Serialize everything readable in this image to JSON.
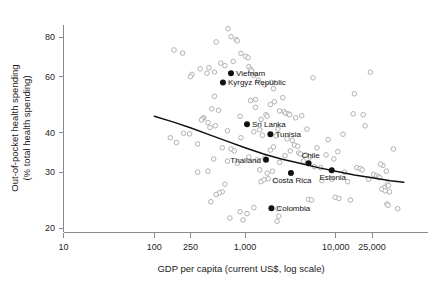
{
  "chart_data": {
    "type": "scatter",
    "title": "",
    "xlabel": "GDP per capita (current US$, log scale)",
    "ylabel": "Out-of-pocket health spending\n(% total health spending)",
    "ylabel_line1": "Out-of-pocket health spending",
    "ylabel_line2": "(% total health spending)",
    "x_scale": "log",
    "y_scale": "log",
    "xlim": [
      10,
      60000
    ],
    "ylim": [
      19,
      88
    ],
    "grid": false,
    "legend": false,
    "xticks": [
      10,
      100,
      250,
      1000,
      10000,
      25000
    ],
    "xtick_labels": [
      "10",
      "100",
      "250",
      "1,000",
      "10,000",
      "25,000"
    ],
    "yticks": [
      20,
      30,
      40,
      60,
      80
    ],
    "ytick_labels": [
      "20",
      "30",
      "40",
      "60",
      "80"
    ],
    "series": [
      {
        "name": "countries-unlabeled",
        "marker": "open-circle",
        "color": "#a9a9a9",
        "points": [
          [
            650,
            85
          ],
          [
            700,
            80.2
          ],
          [
            800,
            78.5
          ],
          [
            820,
            77.8
          ],
          [
            480,
            77.2
          ],
          [
            165,
            72.8
          ],
          [
            205,
            71.2
          ],
          [
            900,
            71.0
          ],
          [
            1020,
            69.5
          ],
          [
            1080,
            68.8
          ],
          [
            740,
            67.0
          ],
          [
            540,
            66.2
          ],
          [
            600,
            65.0
          ],
          [
            1100,
            64.5
          ],
          [
            400,
            64.0
          ],
          [
            320,
            63.5
          ],
          [
            1150,
            63.2
          ],
          [
            1180,
            62.5
          ],
          [
            24000,
            62.0
          ],
          [
            460,
            62.0
          ],
          [
            380,
            61.5
          ],
          [
            260,
            61.0
          ],
          [
            1250,
            60.5
          ],
          [
            5600,
            59.5
          ],
          [
            250,
            60.0
          ],
          [
            1400,
            58.5
          ],
          [
            1950,
            57.5
          ],
          [
            1650,
            56.5
          ],
          [
            2050,
            55.0
          ],
          [
            16000,
            53.0
          ],
          [
            460,
            52.0
          ],
          [
            2600,
            51.5
          ],
          [
            2100,
            50.0
          ],
          [
            1900,
            49.0
          ],
          [
            1300,
            48.0
          ],
          [
            430,
            47.5
          ],
          [
            510,
            47.0
          ],
          [
            2400,
            46.8
          ],
          [
            2700,
            46.5
          ],
          [
            2800,
            46.0
          ],
          [
            3000,
            45.8
          ],
          [
            3100,
            45.5
          ],
          [
            1700,
            45.5
          ],
          [
            1750,
            45.0
          ],
          [
            880,
            45.0
          ],
          [
            350,
            44.5
          ],
          [
            340,
            44.2
          ],
          [
            330,
            43.8
          ],
          [
            4200,
            45.2
          ],
          [
            20000,
            45.5
          ],
          [
            390,
            43.0
          ],
          [
            3600,
            44.5
          ],
          [
            1500,
            44.0
          ],
          [
            470,
            42.0
          ],
          [
            410,
            41.5
          ],
          [
            21000,
            42.0
          ],
          [
            2300,
            41.0
          ],
          [
            1450,
            40.8
          ],
          [
            1250,
            40.2
          ],
          [
            4800,
            41.0
          ],
          [
            640,
            40.5
          ],
          [
            210,
            39.8
          ],
          [
            245,
            39.6
          ],
          [
            1550,
            39.2
          ],
          [
            2200,
            39.0
          ],
          [
            900,
            38.5
          ],
          [
            2900,
            38.2
          ],
          [
            3300,
            37.8
          ],
          [
            8200,
            38.0
          ],
          [
            150,
            38.5
          ],
          [
            175,
            37.2
          ],
          [
            300,
            36.8
          ],
          [
            3500,
            36.5
          ],
          [
            3800,
            36.2
          ],
          [
            2050,
            36.0
          ],
          [
            43000,
            35.5
          ],
          [
            10500,
            34.8
          ],
          [
            700,
            35.5
          ],
          [
            760,
            35.0
          ],
          [
            560,
            35.8
          ],
          [
            1900,
            35.2
          ],
          [
            3150,
            35.0
          ],
          [
            3900,
            34.5
          ],
          [
            4100,
            34.2
          ],
          [
            4600,
            34.0
          ],
          [
            2750,
            33.8
          ],
          [
            5200,
            33.5
          ],
          [
            1650,
            33.2
          ],
          [
            9500,
            33.0
          ],
          [
            1100,
            33.5
          ],
          [
            1350,
            32.8
          ],
          [
            4400,
            32.5
          ],
          [
            2400,
            32.2
          ],
          [
            640,
            32.5
          ],
          [
            33000,
            31.5
          ],
          [
            5800,
            31.2
          ],
          [
            17000,
            31.0
          ],
          [
            18500,
            30.8
          ],
          [
            19500,
            30.5
          ],
          [
            31000,
            31.8
          ],
          [
            36000,
            30.2
          ],
          [
            12500,
            30.0
          ],
          [
            2000,
            30.2
          ],
          [
            1750,
            29.8
          ],
          [
            26000,
            29.5
          ],
          [
            28000,
            29.2
          ],
          [
            29500,
            29.0
          ],
          [
            30500,
            28.8
          ],
          [
            9000,
            28.5
          ],
          [
            7000,
            28.2
          ],
          [
            1500,
            28.0
          ],
          [
            1620,
            28.4
          ],
          [
            1800,
            28.6
          ],
          [
            2150,
            28.2
          ],
          [
            37000,
            27.5
          ],
          [
            38000,
            27.2
          ],
          [
            34000,
            26.8
          ],
          [
            32000,
            26.5
          ],
          [
            35000,
            26.2
          ],
          [
            39000,
            26.0
          ],
          [
            600,
            27.5
          ],
          [
            560,
            26.0
          ],
          [
            520,
            25.8
          ],
          [
            480,
            25.5
          ],
          [
            9800,
            25.0
          ],
          [
            10800,
            24.8
          ],
          [
            5000,
            24.6
          ],
          [
            5400,
            24.5
          ],
          [
            14500,
            24.5
          ],
          [
            420,
            24.2
          ],
          [
            36500,
            23.8
          ],
          [
            37500,
            23.6
          ],
          [
            48000,
            23.0
          ],
          [
            1250,
            23.2
          ],
          [
            2300,
            23.0
          ],
          [
            880,
            22.5
          ],
          [
            1050,
            22.2
          ],
          [
            2350,
            21.8
          ],
          [
            680,
            21.5
          ],
          [
            950,
            21.2
          ],
          [
            2250,
            21.0
          ],
          [
            390,
            30.2
          ],
          [
            300,
            30.0
          ],
          [
            450,
            33.0
          ],
          [
            1450,
            30.5
          ],
          [
            820,
            32.0
          ],
          [
            7800,
            34.0
          ],
          [
            6200,
            35.8
          ],
          [
            15500,
            45.8
          ],
          [
            12000,
            39.5
          ],
          [
            6800,
            31.0
          ],
          [
            13500,
            28.0
          ],
          [
            23000,
            28.5
          ],
          [
            1150,
            50.5
          ],
          [
            1300,
            50.8
          ]
        ]
      },
      {
        "name": "countries-labeled",
        "marker": "filled-circle",
        "color": "#111111",
        "points": [
          {
            "label": "Vietnam",
            "x": 700,
            "y": 61.5,
            "label_pos": "right"
          },
          {
            "label": "Kyrgyz Republic",
            "x": 570,
            "y": 57.5,
            "label_pos": "right"
          },
          {
            "label": "Sri Lanka",
            "x": 1050,
            "y": 42.5,
            "label_pos": "right"
          },
          {
            "label": "Tunisia",
            "x": 1900,
            "y": 39.5,
            "label_pos": "right"
          },
          {
            "label": "Thailand",
            "x": 1700,
            "y": 32.8,
            "label_pos": "left"
          },
          {
            "label": "Chile",
            "x": 5000,
            "y": 32.0,
            "label_pos": "above"
          },
          {
            "label": "Costa Rica",
            "x": 3200,
            "y": 29.8,
            "label_pos": "below"
          },
          {
            "label": "Estonia",
            "x": 9000,
            "y": 30.4,
            "label_pos": "below"
          },
          {
            "label": "Colombia",
            "x": 1950,
            "y": 23.1,
            "label_pos": "right"
          }
        ]
      }
    ],
    "trend_line": {
      "name": "fitted-trend",
      "color": "#111111",
      "description": "Downward sloping fitted curve across the GDP range",
      "points": [
        [
          100,
          45.0
        ],
        [
          160,
          43.2
        ],
        [
          250,
          41.4
        ],
        [
          400,
          39.4
        ],
        [
          640,
          37.5
        ],
        [
          1000,
          35.8
        ],
        [
          1600,
          34.2
        ],
        [
          2500,
          33.0
        ],
        [
          4000,
          32.0
        ],
        [
          6400,
          31.0
        ],
        [
          10000,
          30.2
        ],
        [
          16000,
          29.4
        ],
        [
          25000,
          28.8
        ],
        [
          40000,
          28.2
        ],
        [
          56000,
          27.9
        ]
      ]
    }
  }
}
